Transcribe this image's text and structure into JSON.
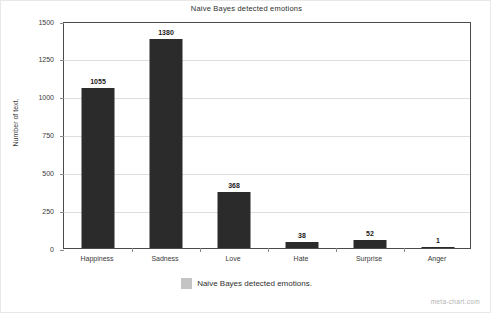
{
  "chart_data": {
    "type": "bar",
    "title": "Naive Bayes detected emotions",
    "xlabel": "",
    "ylabel": "Number of text.",
    "categories": [
      "Happiness",
      "Sadness",
      "Love",
      "Hate",
      "Surprise",
      "Anger"
    ],
    "values": [
      1055,
      1380,
      368,
      38,
      52,
      1
    ],
    "series": [
      {
        "name": "Naive Bayes detected emotions.",
        "values": [
          1055,
          1380,
          368,
          38,
          52,
          1
        ]
      }
    ],
    "ylim": [
      0,
      1500
    ],
    "yticks": [
      0,
      250,
      500,
      750,
      1000,
      1250,
      1500
    ],
    "ytick_labels": [
      "0",
      "250",
      "500",
      "750",
      "1000",
      "1250",
      "1500"
    ],
    "grid": true,
    "legend_position": "bottom",
    "bar_color": "#2b2b2b",
    "legend_swatch_color": "#c4c4c4",
    "gridline_color": "#dedede",
    "axis_color": "#4a4a4a"
  },
  "legend": {
    "label": "Naive Bayes detected emotions."
  },
  "watermark": {
    "text": "meta-chart.com"
  }
}
